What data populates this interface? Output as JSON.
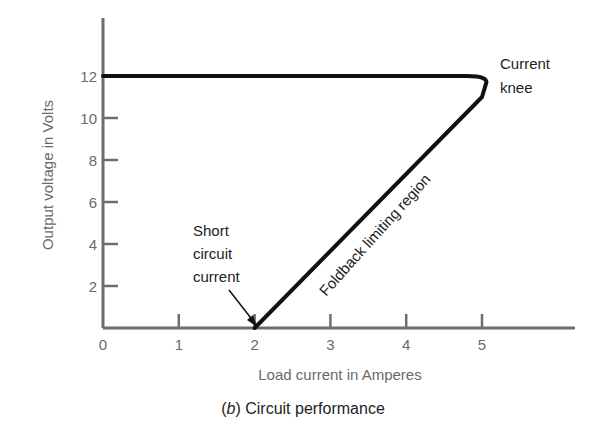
{
  "chart_data": {
    "type": "line",
    "title": "",
    "caption": "(b) Circuit performance",
    "caption_prefix": "(b)",
    "caption_text": "Circuit performance",
    "xlabel": "Load current in Amperes",
    "ylabel": "Output voltage in Volts",
    "xlim": [
      0,
      6
    ],
    "ylim": [
      0,
      14
    ],
    "xticks": [
      0,
      1,
      2,
      3,
      4,
      5
    ],
    "yticks": [
      2,
      4,
      6,
      8,
      10,
      12
    ],
    "grid": false,
    "series": [
      {
        "name": "Foldback current limiting characteristic",
        "x": [
          0,
          4.8,
          5.05,
          5.0,
          2.0
        ],
        "y": [
          12,
          12,
          11.6,
          11.0,
          0
        ]
      }
    ],
    "annotations": [
      {
        "text": "Current knee",
        "lines": [
          "Current",
          "knee"
        ],
        "x": 5.05,
        "y": 11.6
      },
      {
        "text": "Foldback limiting region",
        "rotation_deg": -48
      },
      {
        "text": "Short circuit current",
        "lines": [
          "Short",
          "circuit",
          "current"
        ],
        "x": 2,
        "y": 0,
        "arrow": true
      }
    ]
  }
}
